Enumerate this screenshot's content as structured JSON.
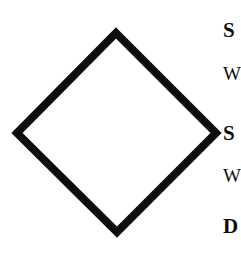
{
  "page": {
    "background_color": "#ffffff",
    "ink_color": "#0d0d0d",
    "width": 241,
    "height": 255
  },
  "figure": {
    "name": "diamond-outline",
    "shape": "diamond",
    "stroke_color": "#0d0d0d",
    "fill_color": "#ffffff",
    "stroke_width": 8,
    "vertices": {
      "top": {
        "x": 116,
        "y": 33
      },
      "right": {
        "x": 216,
        "y": 133
      },
      "bottom": {
        "x": 117,
        "y": 232
      },
      "left": {
        "x": 17,
        "y": 133
      }
    },
    "center": {
      "x": 117,
      "y": 133
    },
    "width": 199,
    "height": 199
  },
  "text_column": {
    "note": "Right-hand text column is cropped by the image edge; only the first glyph of each line is visible.",
    "lines": [
      {
        "id": "line-1",
        "style": "heading",
        "visible_text": "S"
      },
      {
        "id": "line-2",
        "style": "body",
        "visible_text": "W"
      },
      {
        "id": "line-3",
        "style": "heading",
        "visible_text": "S"
      },
      {
        "id": "line-4",
        "style": "body",
        "visible_text": "W"
      },
      {
        "id": "line-5",
        "style": "heading",
        "visible_text": "D"
      }
    ]
  }
}
